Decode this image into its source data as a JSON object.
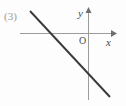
{
  "figure": {
    "item_number": "(3)",
    "background_color": "#fdfdfd",
    "axis_color": "#9b9b9b",
    "line_color": "#3a3a3a",
    "labels": {
      "x_axis": "x",
      "y_axis": "y",
      "origin": "O"
    }
  },
  "chart_data": {
    "type": "line",
    "title": "",
    "subtitle": "",
    "xlabel": "x",
    "ylabel": "y",
    "grid": false,
    "legend_position": "none",
    "annotations": [
      "(3)",
      "O"
    ],
    "axes": {
      "origin_px": {
        "x": 88,
        "y": 33
      },
      "x_axis_px": {
        "x1": 20,
        "y1": 33,
        "x2": 114,
        "y2": 33,
        "arrow": "right"
      },
      "y_axis_px": {
        "x1": 88,
        "y1": 8,
        "x2": 88,
        "y2": 100,
        "arrow": "up"
      }
    },
    "series": [
      {
        "name": "line",
        "description": "straight line with negative slope, crossing x-axis left of origin and y-axis below origin",
        "endpoints_px": [
          {
            "x": 30,
            "y": 11
          },
          {
            "x": 110,
            "y": 97
          }
        ],
        "x_intercept_px": {
          "x": 52,
          "y": 33
        },
        "y_intercept_px": {
          "x": 88,
          "y": 77
        },
        "slope_sign": "negative",
        "x_intercept_sign": "negative",
        "y_intercept_sign": "negative"
      }
    ]
  }
}
